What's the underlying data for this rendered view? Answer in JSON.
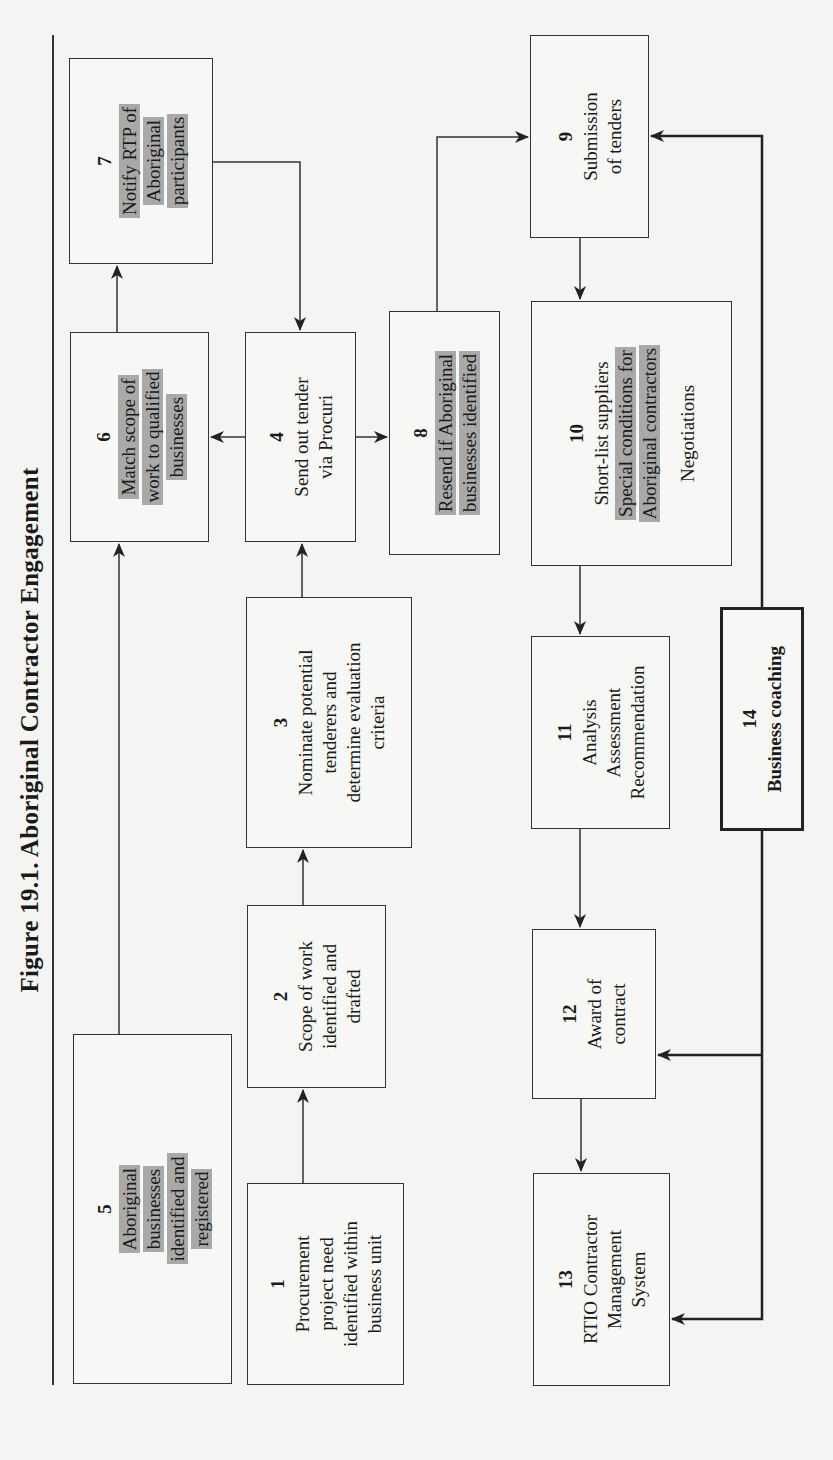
{
  "figure": {
    "title": "Figure 19.1.  Aboriginal Contractor Engagement"
  },
  "boxes": {
    "b1": {
      "num": "1",
      "lines": [
        "Procurement",
        "project need",
        "identified within",
        "business unit"
      ],
      "highlight": false
    },
    "b2": {
      "num": "2",
      "lines": [
        "Scope of work",
        "identified and",
        "drafted"
      ],
      "highlight": false
    },
    "b3": {
      "num": "3",
      "lines": [
        "Nominate potential",
        "tenderers and",
        "determine evaluation",
        "criteria"
      ],
      "highlight": false
    },
    "b4": {
      "num": "4",
      "lines": [
        "Send out tender",
        "via Procuri"
      ],
      "highlight": false
    },
    "b5": {
      "num": "5",
      "lines": [
        "Aboriginal",
        "businesses",
        "identified and",
        "registered"
      ],
      "highlight": true
    },
    "b6": {
      "num": "6",
      "lines": [
        "Match scope of",
        "work to qualified",
        "businesses"
      ],
      "highlight": true
    },
    "b7": {
      "num": "7",
      "lines": [
        "Notify RTP of",
        "Aboriginal",
        "participants"
      ],
      "highlight": true
    },
    "b8": {
      "num": "8",
      "lines": [
        "Resend if Aboriginal",
        "businesses identified"
      ],
      "highlight": true
    },
    "b9": {
      "num": "9",
      "lines": [
        "Submission",
        "of tenders"
      ],
      "highlight": false
    },
    "b10": {
      "num": "10",
      "line1": "Short-list suppliers",
      "hl_lines": [
        "Special conditions for",
        "Aboriginal contractors"
      ],
      "line_last": "Negotiations"
    },
    "b11": {
      "num": "11",
      "lines": [
        "Analysis",
        "Assessment",
        "Recommendation"
      ],
      "highlight": false
    },
    "b12": {
      "num": "12",
      "lines": [
        "Award of",
        "contract"
      ],
      "highlight": false
    },
    "b13": {
      "num": "13",
      "lines": [
        "RTIO Contractor",
        "Management",
        "System"
      ],
      "highlight": false
    },
    "b14": {
      "num": "14",
      "lines": [
        "Business coaching"
      ],
      "highlight": false,
      "emphasis": "thick-border-bold"
    }
  },
  "connections": [
    {
      "from": "1",
      "to": "2"
    },
    {
      "from": "2",
      "to": "3"
    },
    {
      "from": "3",
      "to": "4"
    },
    {
      "from": "5",
      "to": "6"
    },
    {
      "from": "4",
      "to": "6"
    },
    {
      "from": "6",
      "to": "7"
    },
    {
      "from": "7",
      "to": "4"
    },
    {
      "from": "4",
      "to": "8"
    },
    {
      "from": "8",
      "to": "9"
    },
    {
      "from": "9",
      "to": "10"
    },
    {
      "from": "10",
      "to": "11"
    },
    {
      "from": "11",
      "to": "12"
    },
    {
      "from": "12",
      "to": "13"
    },
    {
      "from": "14",
      "to": "9"
    },
    {
      "from": "14",
      "to": "12"
    },
    {
      "from": "14",
      "to": "13"
    }
  ],
  "colors": {
    "highlight": "#a9a9a9",
    "line": "#333333",
    "background": "#f4f4f2"
  },
  "orientation": "rotated 90 degrees counter-clockwise"
}
